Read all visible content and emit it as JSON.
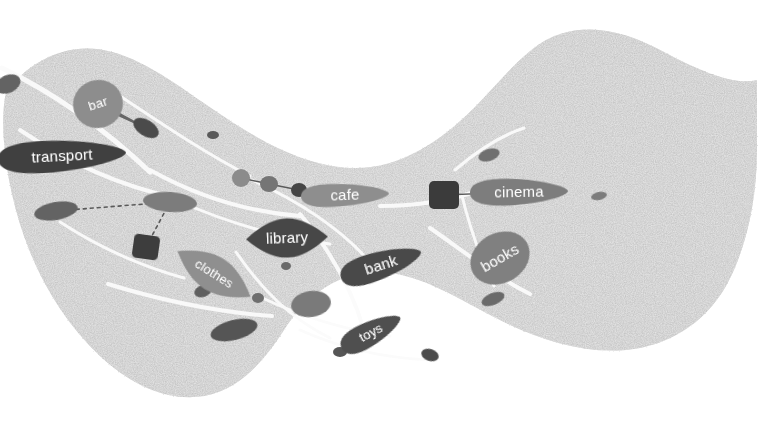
{
  "canvas": {
    "width": 760,
    "height": 426,
    "background_color": "#ffffff",
    "landmass_fill": "#e3e3e3",
    "landmass_texture": "speckled-noise",
    "style": "hand-drawn-sketch-map"
  },
  "palette": {
    "label_text": "#ffffff",
    "very_dark": "#3c3c3c",
    "dark": "#4e4e4e",
    "mid_dark": "#5d5d5d",
    "mid": "#737373",
    "mid_light": "#8a8a8a",
    "light": "#9e9e9e",
    "connector": "#5a5a5a",
    "path_highlight": "#fbfbfb"
  },
  "map": {
    "title": "amenity map",
    "labeled_nodes": [
      {
        "id": "transport",
        "label": "transport",
        "x": 62,
        "y": 156,
        "rx": 64,
        "ry": 18,
        "rotate": -3,
        "fill": "#3f3f3f",
        "shape": "ellipse",
        "font": "big"
      },
      {
        "id": "bar",
        "label": "bar",
        "x": 98,
        "y": 104,
        "rx": 25,
        "ry": 24,
        "rotate": -18,
        "fill": "#8d8d8d",
        "shape": "circle",
        "font": "small"
      },
      {
        "id": "cafe",
        "label": "cafe",
        "x": 345,
        "y": 195,
        "rx": 44,
        "ry": 13,
        "rotate": -2,
        "fill": "#8e8e8e",
        "shape": "ellipse",
        "font": "big"
      },
      {
        "id": "cinema",
        "label": "cinema",
        "x": 519,
        "y": 192,
        "rx": 49,
        "ry": 15,
        "rotate": -1,
        "fill": "#7d7d7d",
        "shape": "ellipse",
        "font": "big"
      },
      {
        "id": "library",
        "label": "library",
        "x": 287,
        "y": 238,
        "rx": 41,
        "ry": 20,
        "rotate": -2,
        "fill": "#464646",
        "shape": "lens",
        "font": "big"
      },
      {
        "id": "bank",
        "label": "bank",
        "x": 381,
        "y": 265,
        "rx": 42,
        "ry": 16,
        "rotate": -18,
        "fill": "#4a4a4a",
        "shape": "ellipse",
        "font": "big"
      },
      {
        "id": "books",
        "label": "books",
        "x": 500,
        "y": 258,
        "rx": 31,
        "ry": 25,
        "rotate": -30,
        "fill": "#808080",
        "shape": "ellipse",
        "font": "big"
      },
      {
        "id": "clothes",
        "label": "clothes",
        "x": 214,
        "y": 274,
        "rx": 43,
        "ry": 18,
        "rotate": 32,
        "fill": "#8f8f8f",
        "shape": "lens",
        "font": "small"
      },
      {
        "id": "toys",
        "label": "toys",
        "x": 371,
        "y": 333,
        "rx": 33,
        "ry": 14,
        "rotate": -28,
        "fill": "#4f4f4f",
        "shape": "ellipse",
        "font": "small"
      }
    ],
    "unlabeled_nodes": [
      {
        "id": "u01",
        "x": 8,
        "y": 84,
        "rx": 13,
        "ry": 9,
        "rotate": -25,
        "fill": "#636363",
        "shape": "ellipse"
      },
      {
        "id": "u02",
        "x": 146,
        "y": 128,
        "rx": 14,
        "ry": 8,
        "rotate": 32,
        "fill": "#4c4c4c",
        "shape": "ellipse"
      },
      {
        "id": "u03",
        "x": 213,
        "y": 135,
        "rx": 6,
        "ry": 4,
        "rotate": 0,
        "fill": "#5a5a5a",
        "shape": "ellipse"
      },
      {
        "id": "u04",
        "x": 241,
        "y": 178,
        "rx": 9,
        "ry": 9,
        "rotate": 0,
        "fill": "#8b8b8b",
        "shape": "circle"
      },
      {
        "id": "u05",
        "x": 269,
        "y": 184,
        "rx": 9,
        "ry": 8,
        "rotate": 0,
        "fill": "#757575",
        "shape": "circle"
      },
      {
        "id": "u06",
        "x": 299,
        "y": 190,
        "rx": 8,
        "ry": 7,
        "rotate": 0,
        "fill": "#454545",
        "shape": "circle"
      },
      {
        "id": "u07",
        "x": 170,
        "y": 202,
        "rx": 27,
        "ry": 10,
        "rotate": 4,
        "fill": "#7c7c7c",
        "shape": "ellipse"
      },
      {
        "id": "u08",
        "x": 56,
        "y": 211,
        "rx": 22,
        "ry": 9,
        "rotate": -10,
        "fill": "#636363",
        "shape": "ellipse"
      },
      {
        "id": "u09",
        "x": 146,
        "y": 247,
        "rx": 13,
        "ry": 12,
        "rotate": 8,
        "fill": "#3e3e3e",
        "shape": "roundsquare"
      },
      {
        "id": "u10",
        "x": 444,
        "y": 195,
        "rx": 15,
        "ry": 14,
        "rotate": 0,
        "fill": "#3b3b3b",
        "shape": "roundsquare"
      },
      {
        "id": "u11",
        "x": 489,
        "y": 155,
        "rx": 11,
        "ry": 6,
        "rotate": -18,
        "fill": "#707070",
        "shape": "ellipse"
      },
      {
        "id": "u12",
        "x": 286,
        "y": 266,
        "rx": 5,
        "ry": 4,
        "rotate": 0,
        "fill": "#6b6b6b",
        "shape": "ellipse"
      },
      {
        "id": "u13",
        "x": 258,
        "y": 298,
        "rx": 6,
        "ry": 5,
        "rotate": 0,
        "fill": "#6e6e6e",
        "shape": "ellipse"
      },
      {
        "id": "u14",
        "x": 311,
        "y": 304,
        "rx": 20,
        "ry": 13,
        "rotate": -8,
        "fill": "#7a7a7a",
        "shape": "ellipse"
      },
      {
        "id": "u15",
        "x": 234,
        "y": 330,
        "rx": 24,
        "ry": 10,
        "rotate": -14,
        "fill": "#545454",
        "shape": "ellipse"
      },
      {
        "id": "u16",
        "x": 203,
        "y": 291,
        "rx": 9,
        "ry": 6,
        "rotate": -20,
        "fill": "#5e5e5e",
        "shape": "ellipse"
      },
      {
        "id": "u17",
        "x": 493,
        "y": 299,
        "rx": 12,
        "ry": 6,
        "rotate": -22,
        "fill": "#6a6a6a",
        "shape": "ellipse"
      },
      {
        "id": "u18",
        "x": 430,
        "y": 355,
        "rx": 9,
        "ry": 6,
        "rotate": 18,
        "fill": "#4c4c4c",
        "shape": "ellipse"
      },
      {
        "id": "u19",
        "x": 340,
        "y": 352,
        "rx": 7,
        "ry": 5,
        "rotate": 0,
        "fill": "#565656",
        "shape": "ellipse"
      },
      {
        "id": "u20",
        "x": 599,
        "y": 196,
        "rx": 8,
        "ry": 4,
        "rotate": -12,
        "fill": "#7b7b7b",
        "shape": "ellipse"
      }
    ],
    "connectors": [
      {
        "id": "c-bar",
        "from": "bar",
        "to": "u02",
        "kind": "taper"
      },
      {
        "id": "c-chain1",
        "from": "u04",
        "to": "u05",
        "kind": "line"
      },
      {
        "id": "c-chain2",
        "from": "u05",
        "to": "u06",
        "kind": "line"
      },
      {
        "id": "c-chain3",
        "from": "u06",
        "to": "cafe",
        "kind": "line"
      },
      {
        "id": "c-cinema",
        "from": "u10",
        "to": "cinema",
        "kind": "line"
      },
      {
        "id": "c-dash",
        "from": "u09",
        "to": "u07",
        "kind": "dashed"
      },
      {
        "id": "c-dash2",
        "from": "u07",
        "to": "u08",
        "kind": "dashed"
      }
    ]
  }
}
